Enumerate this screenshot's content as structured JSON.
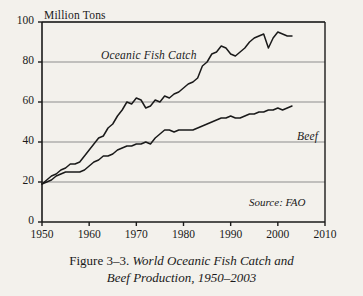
{
  "figure": {
    "caption_lead": "Figure 3–3.",
    "caption_line1": " World Oceanic Fish Catch and",
    "caption_line2": "Beef Production, 1950–2003",
    "source_note": "Source: FAO",
    "background_color": "#f3f1ec",
    "ink_color": "#1a1a1a",
    "gridline_color": "#8d8d8d"
  },
  "chart_data": {
    "type": "line",
    "title": "World Oceanic Fish Catch and Beef Production, 1950–2003",
    "xlabel": "",
    "ylabel": "Million Tons",
    "ylim": [
      0,
      100
    ],
    "xlim": [
      1950,
      2010
    ],
    "yticks": [
      0,
      20,
      40,
      60,
      80,
      100
    ],
    "xticks": [
      1950,
      1960,
      1970,
      1980,
      1990,
      2000,
      2010
    ],
    "grid": true,
    "legend_position": "inline-annotation",
    "annotations": [
      {
        "text": "Oceanic Fish Catch",
        "series": "Oceanic Fish Catch"
      },
      {
        "text": "Beef",
        "series": "Beef"
      },
      {
        "text": "Source: FAO",
        "series": null
      }
    ],
    "x": [
      1950,
      1951,
      1952,
      1953,
      1954,
      1955,
      1956,
      1957,
      1958,
      1959,
      1960,
      1961,
      1962,
      1963,
      1964,
      1965,
      1966,
      1967,
      1968,
      1969,
      1970,
      1971,
      1972,
      1973,
      1974,
      1975,
      1976,
      1977,
      1978,
      1979,
      1980,
      1981,
      1982,
      1983,
      1984,
      1985,
      1986,
      1987,
      1988,
      1989,
      1990,
      1991,
      1992,
      1993,
      1994,
      1995,
      1996,
      1997,
      1998,
      1999,
      2000,
      2001,
      2002,
      2003
    ],
    "series": [
      {
        "name": "Oceanic Fish Catch",
        "values": [
          19,
          21,
          23,
          24,
          26,
          27,
          29,
          29,
          30,
          33,
          36,
          39,
          42,
          43,
          47,
          49,
          53,
          56,
          60,
          59,
          62,
          61,
          57,
          58,
          61,
          60,
          63,
          62,
          64,
          65,
          67,
          69,
          70,
          72,
          78,
          80,
          84,
          85,
          88,
          87,
          84,
          83,
          85,
          87,
          90,
          92,
          93,
          94,
          87,
          92,
          95,
          94,
          93,
          93
        ]
      },
      {
        "name": "Beef",
        "values": [
          19,
          20,
          21,
          23,
          24,
          25,
          25,
          25,
          25,
          26,
          28,
          30,
          31,
          33,
          33,
          34,
          36,
          37,
          38,
          38,
          39,
          39,
          40,
          39,
          42,
          44,
          46,
          46,
          45,
          46,
          46,
          46,
          46,
          47,
          48,
          49,
          50,
          51,
          52,
          52,
          53,
          52,
          52,
          53,
          54,
          54,
          55,
          55,
          56,
          56,
          57,
          56,
          57,
          58
        ]
      }
    ]
  },
  "axis": {
    "unit_label": "Million Tons",
    "y_tick_labels": [
      "0",
      "20",
      "40",
      "60",
      "80",
      "100"
    ],
    "x_tick_labels": [
      "1950",
      "1960",
      "1970",
      "1980",
      "1990",
      "2000",
      "2010"
    ]
  }
}
